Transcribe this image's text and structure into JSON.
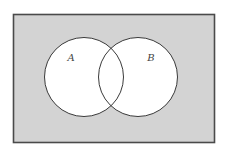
{
  "diagram": {
    "type": "venn",
    "universe": {
      "x": 13.5,
      "y": 14.5,
      "width": 201,
      "height": 128,
      "fill": "#d3d3d3",
      "stroke": "#4a4a4a"
    },
    "sets": [
      {
        "label": "A",
        "cx": 84,
        "cy": 77,
        "r": 39.5,
        "label_x": 71,
        "label_y": 61
      },
      {
        "label": "B",
        "cx": 138,
        "cy": 77,
        "r": 39.5,
        "label_x": 151,
        "label_y": 61
      }
    ],
    "colors": {
      "circle_fill": "#ffffff",
      "circle_stroke": "#3a3a3a",
      "label": "#444444"
    }
  }
}
